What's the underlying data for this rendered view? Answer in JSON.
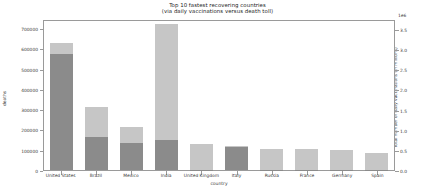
{
  "chart_data": {
    "type": "bar",
    "title": "Top 10 fastest recovering countries",
    "subtitle": "(via daily vaccinations versus death toll)",
    "xlabel": "country",
    "ylabel": "deaths",
    "ylabel_right": "Total number of daily vaccinations (in millions)",
    "right_axis_offset_label": "1e6",
    "grid": false,
    "stacked": true,
    "legend_position": "none",
    "categories": [
      "United States",
      "Brazil",
      "Mexico",
      "India",
      "United Kingdom",
      "Italy",
      "Russia",
      "France",
      "Germany",
      "Spain"
    ],
    "ylim": [
      0,
      745000
    ],
    "yticks": [
      0,
      100000,
      200000,
      300000,
      400000,
      500000,
      600000,
      700000
    ],
    "ytick_labels": [
      "0",
      "100000",
      "200000",
      "300000",
      "400000",
      "500000",
      "600000",
      "700000"
    ],
    "ylim_right": [
      0.0,
      3.75
    ],
    "yticks_right": [
      0.0,
      0.5,
      1.0,
      1.5,
      2.0,
      2.5,
      3.0,
      3.5
    ],
    "ytick_labels_right": [
      "0.0",
      "0.5",
      "1.0",
      "1.5",
      "2.0",
      "2.5",
      "3.0",
      "3.5"
    ],
    "series": [
      {
        "name": "deaths",
        "color": "#8b8b8b",
        "values": [
          573000,
          162000,
          135000,
          148000,
          1000,
          113000,
          1000,
          1000,
          1000,
          1000
        ]
      },
      {
        "name": "daily vaccinations",
        "color": "#c6c6c6",
        "values": [
          53000,
          148000,
          79000,
          574000,
          125000,
          5000,
          103000,
          103000,
          97000,
          81000
        ]
      }
    ],
    "totals": [
      626000,
      310000,
      214000,
      722000,
      126000,
      118000,
      104000,
      104000,
      98000,
      82000
    ]
  }
}
